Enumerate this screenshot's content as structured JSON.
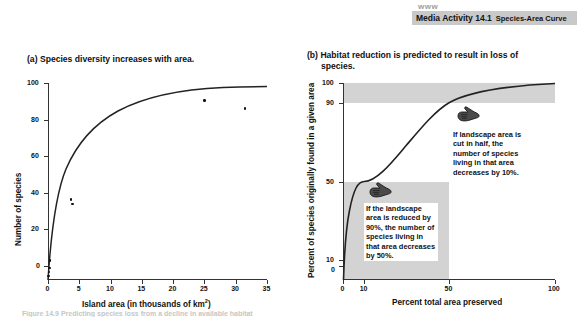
{
  "banner": {
    "www_mark": "www",
    "activity_title": "Media Activity 14.1",
    "activity_subtitle": "Species-Area Curve",
    "background_color": "#c9c9c9"
  },
  "panel_a": {
    "caption_label": "(a)",
    "caption_text": "Species diversity increases with area."
  },
  "panel_b": {
    "caption_label": "(b)",
    "caption_text": "Habitat reduction is predicted to result in loss of",
    "caption_text_line2": "species.",
    "shade_color": "#d3d3d3",
    "callout_1": "If landscape area is cut in half, the number of species living in that area decreases by 10%.",
    "callout_2": "If the landscape area is reduced by 90%, the number of species living in that area decreases by 50%.",
    "hand_icon_1": "pointing-hand-icon",
    "hand_icon_2": "pointing-hand-icon"
  },
  "bottom_caption": {
    "text": "Figure 14.9 Predicting species loss from a decline in available habitat"
  },
  "chart_data": [
    {
      "type": "scatter",
      "id": "species-area-curve",
      "title": "(a) Species diversity increases with area.",
      "xlabel": "Island area (in thousands of km2)",
      "xlabel_display": "Island area (in thousands of km²)",
      "ylabel": "Number of species",
      "xlim": [
        0,
        35
      ],
      "ylim": [
        0,
        100
      ],
      "xticks": [
        0,
        5,
        10,
        15,
        20,
        25,
        30,
        35
      ],
      "yticks": [
        0,
        20,
        40,
        60,
        80,
        100
      ],
      "grid": false,
      "legend": "none",
      "points": [
        {
          "x": 0.1,
          "y": 2
        },
        {
          "x": 0.15,
          "y": 4
        },
        {
          "x": 0.2,
          "y": 6
        },
        {
          "x": 0.3,
          "y": 10
        },
        {
          "x": 3.7,
          "y": 41
        },
        {
          "x": 3.9,
          "y": 38.5
        },
        {
          "x": 25.0,
          "y": 91
        },
        {
          "x": 31.5,
          "y": 87
        }
      ],
      "fit_curve": {
        "description": "saturating species-area curve S = 91*(1-exp(-x/7.2))",
        "asymptote": 91,
        "scale": 7.2
      }
    },
    {
      "type": "line",
      "id": "habitat-reduction-curve",
      "title": "(b) Habitat reduction is predicted to result in loss of species.",
      "xlabel": "Percent total area preserved",
      "ylabel": "Percent of species originally found in a given area",
      "xlim": [
        0,
        100
      ],
      "ylim": [
        0,
        100
      ],
      "xticks": [
        0,
        10,
        50,
        100
      ],
      "yticks": [
        0,
        10,
        50,
        90,
        100
      ],
      "grid": false,
      "legend": "none",
      "curve_points": [
        {
          "x": 0,
          "y": 0
        },
        {
          "x": 1,
          "y": 18
        },
        {
          "x": 3,
          "y": 29
        },
        {
          "x": 5,
          "y": 35
        },
        {
          "x": 10,
          "y": 50
        },
        {
          "x": 20,
          "y": 65
        },
        {
          "x": 30,
          "y": 74
        },
        {
          "x": 40,
          "y": 82
        },
        {
          "x": 50,
          "y": 90
        },
        {
          "x": 60,
          "y": 93
        },
        {
          "x": 70,
          "y": 95
        },
        {
          "x": 80,
          "y": 97
        },
        {
          "x": 90,
          "y": 98.5
        },
        {
          "x": 100,
          "y": 100
        }
      ],
      "shaded_bands": [
        {
          "name": "upper-band",
          "x_from": 0,
          "x_to": 100,
          "y_from": 90,
          "y_to": 100
        },
        {
          "name": "lower-band",
          "x_from": 0,
          "x_to": 50,
          "y_from": 0,
          "y_to": 50
        }
      ],
      "annotations": [
        {
          "name": "half-area-annotation",
          "x": 50,
          "y": 90,
          "text": "If landscape area is cut in half, the number of species living in that area decreases by 10%."
        },
        {
          "name": "ninety-percent-annotation",
          "x": 10,
          "y": 50,
          "text": "If the landscape area is reduced by 90%, the number of species living in that area decreases by 50%."
        }
      ]
    }
  ]
}
